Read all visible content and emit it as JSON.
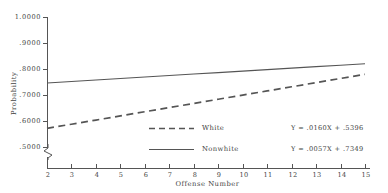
{
  "chart_data": {
    "type": "line",
    "title": "",
    "xlabel": "Offense Number",
    "ylabel": "Probability",
    "xlim": [
      2,
      15
    ],
    "ylim": [
      0.5,
      1.0
    ],
    "grid": false,
    "y_axis_break": true,
    "legend_position": "center",
    "x_tick_labels": [
      "2",
      "3",
      "4",
      "5",
      "6",
      "7",
      "8",
      "9",
      "10",
      "11",
      "12",
      "13",
      "14",
      "15"
    ],
    "y_tick_labels": [
      ".5000",
      ".6000",
      ".7000",
      ".8000",
      ".9000",
      "1.0000"
    ],
    "y_tick_values": [
      0.5,
      0.6,
      0.7,
      0.8,
      0.9,
      1.0
    ],
    "x": [
      2,
      3,
      4,
      5,
      6,
      7,
      8,
      9,
      10,
      11,
      12,
      13,
      14,
      15
    ],
    "series": [
      {
        "name": "White",
        "style": "dashed",
        "color": "#555555",
        "equation": "Y = .0160X + .5396",
        "slope": 0.016,
        "intercept": 0.5396,
        "values": [
          0.5716,
          0.5876,
          0.6036,
          0.6196,
          0.6356,
          0.6516,
          0.6676,
          0.6836,
          0.6996,
          0.7156,
          0.7316,
          0.7476,
          0.7636,
          0.7796
        ]
      },
      {
        "name": "Nonwhite",
        "style": "solid",
        "color": "#555555",
        "equation": "Y = .0057X + .7349",
        "slope": 0.0057,
        "intercept": 0.7349,
        "values": [
          0.7463,
          0.752,
          0.7577,
          0.7634,
          0.7691,
          0.7748,
          0.7805,
          0.7862,
          0.7919,
          0.7976,
          0.8033,
          0.809,
          0.8147,
          0.8204
        ]
      }
    ]
  },
  "legend": {
    "white_label": "White",
    "nonwhite_label": "Nonwhite"
  },
  "equations": {
    "white": "Y = .0160X + .5396",
    "nonwhite": "Y = .0057X + .7349"
  },
  "axes": {
    "y_title": "Probability",
    "x_title": "Offense Number"
  }
}
